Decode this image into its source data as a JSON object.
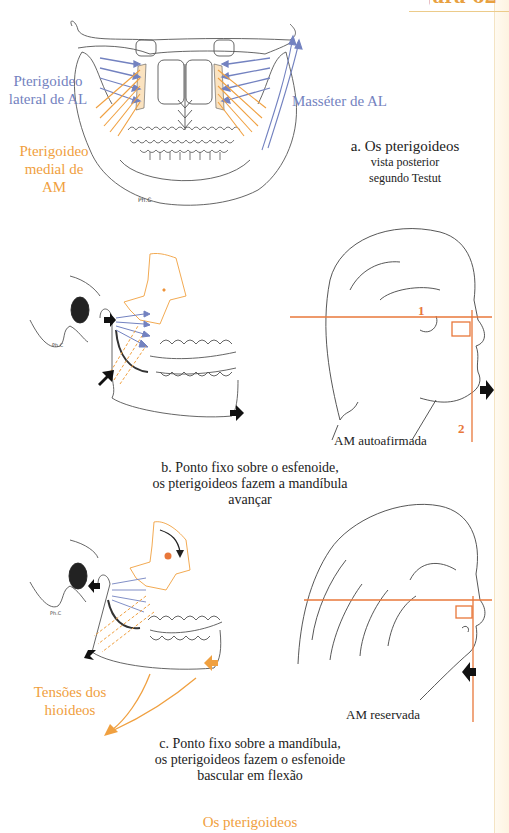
{
  "header": {
    "figure_label": "Figura 62"
  },
  "panel_a": {
    "label_lateral": [
      "Pterigoideo",
      "lateral de AL"
    ],
    "label_medial": [
      "Pterigoideo",
      "medial de AM"
    ],
    "label_masseter": "Masséter de AL",
    "signature": "Ph.C",
    "caption": [
      "a. Os pterigoideos",
      "vista posterior",
      "segundo Testut"
    ]
  },
  "panel_b": {
    "signature": "Ph.C",
    "line_1": "1",
    "line_2": "2",
    "head_label": "AM autoafirmada",
    "caption": [
      "b. Ponto fixo sobre o esfenoide,",
      "os pterigoideos fazem a mandíbula",
      "avançar"
    ]
  },
  "panel_c": {
    "signature": "Ph.C",
    "label_hyoid": [
      "Tensões dos",
      "hioideos"
    ],
    "head_label": "AM reservada",
    "caption": [
      "c. Ponto fixo sobre a mandíbula,",
      "os pterigoideos fazem o esfenoide",
      "bascular em flexão"
    ]
  },
  "footer": {
    "title": "Os pterigoideos"
  },
  "colors": {
    "blue": "#7382c0",
    "orange": "#f0a040",
    "red_line": "#e8773a",
    "ink": "#444444"
  }
}
